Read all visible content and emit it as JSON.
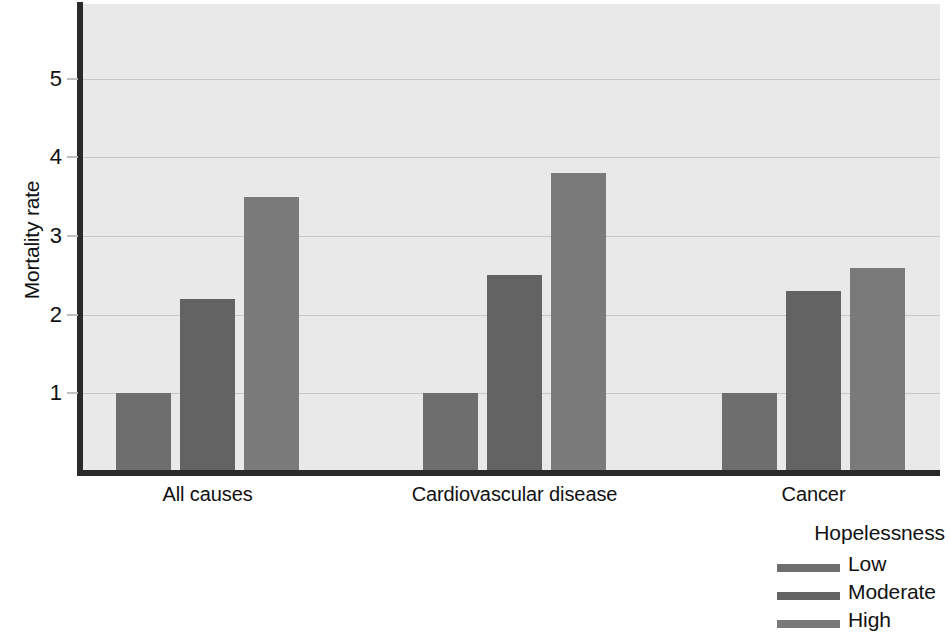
{
  "chart_data": {
    "type": "bar",
    "title": "",
    "xlabel": "",
    "ylabel": "Mortality rate",
    "categories": [
      "All causes",
      "Cardiovascular disease",
      "Cancer"
    ],
    "series": [
      {
        "name": "Low",
        "values": [
          1.0,
          1.0,
          1.0
        ],
        "color": "#6e6e6e"
      },
      {
        "name": "Moderate",
        "values": [
          2.2,
          2.5,
          2.3
        ],
        "color": "#636363"
      },
      {
        "name": "High",
        "values": [
          3.5,
          3.8,
          2.6
        ],
        "color": "#7a7a7a"
      }
    ],
    "ytick_labels": [
      "1",
      "2",
      "3",
      "4",
      "5"
    ],
    "ytick_values": [
      1,
      2,
      3,
      4,
      5
    ],
    "ylim": [
      0,
      5.95
    ],
    "grid": true,
    "legend": {
      "title": "Hopelessness",
      "position": "bottom-right",
      "entries": [
        "Low",
        "Moderate",
        "High"
      ]
    },
    "plot_background_color": "#e9e9e9",
    "axis_color": "#2b2b2b",
    "gridline_color": "#c8c8c8"
  }
}
